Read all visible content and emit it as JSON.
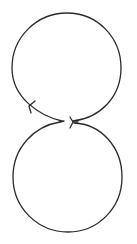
{
  "diagram": {
    "type": "figure-eight-loop",
    "background": "#ffffff",
    "stroke_color": "#2a2a2a",
    "stroke_width": 1.3,
    "upper_loop": {
      "cx": 67,
      "cy": 68,
      "r": 55,
      "path": "M 62 121 C 40 116, 12 98, 12 68 C 12 37, 37 13, 67 13 C 97 13, 121 37, 121 68 C 121 97, 100 118, 73 121"
    },
    "lower_loop": {
      "path": "M 60 122 C 35 126, 13 147, 13 177 C 13 208, 38 232, 68 232 C 98 232, 122 208, 122 177 C 122 146, 100 124, 74 123"
    },
    "arrows": [
      {
        "name": "upper-left-arrowhead",
        "path": "M 29 106 L 35 101 M 29 106 L 31 113"
      },
      {
        "name": "junction-left-arrow-tip",
        "path": "M 60 122 L 64 121"
      },
      {
        "name": "junction-right-arrowhead",
        "path": "M 73 122 L 70 117 M 73 122 L 70 128 M 73 122 L 78 122"
      }
    ]
  }
}
